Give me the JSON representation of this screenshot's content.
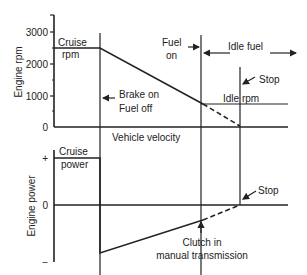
{
  "top_chart": {
    "ylabel": "Engine rpm",
    "ticks": [
      "3000",
      "2000",
      "1000",
      "0"
    ],
    "cruise_label_1": "Cruise",
    "cruise_label_2": "rpm",
    "brake_label_1": "Brake on",
    "brake_label_2": "Fuel off",
    "fuel_on_1": "Fuel",
    "fuel_on_2": "on",
    "idle_fuel": "Idle fuel",
    "stop": "Stop",
    "idle_rpm": "Idle rpm",
    "xlabel": "Vehicle velocity"
  },
  "bottom_chart": {
    "ylabel": "Engine power",
    "tick_plus": "+",
    "tick_zero": "0",
    "tick_minus": "−",
    "cruise_label_1": "Cruise",
    "cruise_label_2": "power",
    "stop": "Stop",
    "clutch_1": "Clutch in",
    "clutch_2": "manual transmission"
  },
  "colors": {
    "line": "#222222",
    "background": "#ffffff"
  }
}
